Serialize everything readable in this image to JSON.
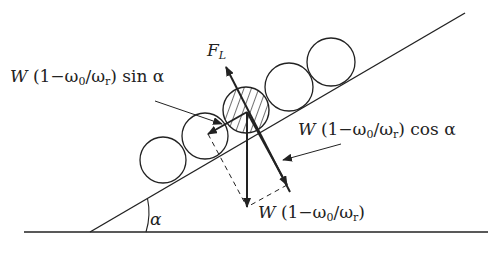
{
  "diagram": {
    "labels": {
      "lift_force": "F",
      "lift_force_sub": "L",
      "sin_component": {
        "prefix": "W",
        "body": "(1−ω",
        "sub0": "0",
        "mid": "/ω",
        "subr": "r",
        "suffix": ") sin α"
      },
      "cos_component": {
        "prefix": "W",
        "body": "(1−ω",
        "sub0": "0",
        "mid": "/ω",
        "subr": "r",
        "suffix": ") cos α"
      },
      "weight": {
        "prefix": "W",
        "body": "(1−ω",
        "sub0": "0",
        "mid": "/ω",
        "subr": "r",
        "suffix": ")"
      },
      "angle": "α"
    },
    "elements": {
      "ground_line": {
        "x1": 24,
        "y1": 232,
        "x2": 488,
        "y2": 232
      },
      "incline_line": {
        "x1": 90,
        "y1": 232,
        "x2": 465,
        "y2": 13
      },
      "rollers": [
        {
          "cx": 163,
          "cy": 160,
          "r": 23,
          "hatched": false
        },
        {
          "cx": 205,
          "cy": 136,
          "r": 23,
          "hatched": false
        },
        {
          "cx": 246,
          "cy": 110,
          "r": 23,
          "hatched": true
        },
        {
          "cx": 289,
          "cy": 87,
          "r": 24,
          "hatched": false
        },
        {
          "cx": 331,
          "cy": 62,
          "r": 24,
          "hatched": false
        }
      ],
      "force_origin": {
        "x": 247,
        "y": 112
      },
      "vectors": {
        "lift": {
          "x2": 226,
          "y2": 67
        },
        "weight": {
          "x2": 247,
          "y2": 207
        },
        "sin": {
          "x2": 208,
          "y2": 134
        },
        "cos": {
          "x2": 287,
          "y2": 185
        }
      }
    },
    "colors": {
      "line": "#222222",
      "background": "#ffffff"
    }
  }
}
